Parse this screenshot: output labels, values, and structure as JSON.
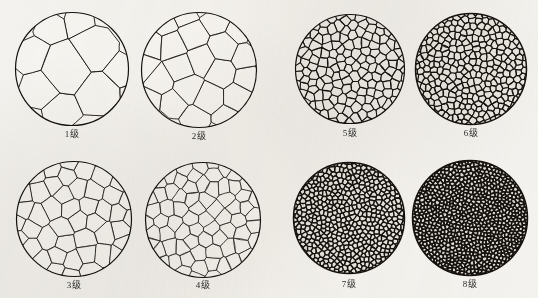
{
  "figure": {
    "title": "",
    "background_color": "#f4f2ee",
    "ink_color": "#15120f",
    "width": 538,
    "height": 298
  },
  "panels": [
    {
      "id": "grade-1",
      "label": "1级",
      "grade": 1,
      "group": "left",
      "row": 0,
      "col": 0,
      "circle": {
        "cx": 72,
        "cy": 69,
        "r": 57
      },
      "caption_y": 129,
      "cells": 11,
      "line_width": 0.9,
      "fill": "#f6f4f0",
      "seed": 1101
    },
    {
      "id": "grade-2",
      "label": "2级",
      "grade": 2,
      "group": "left",
      "row": 0,
      "col": 1,
      "circle": {
        "cx": 199,
        "cy": 70,
        "r": 58
      },
      "caption_y": 131,
      "cells": 26,
      "line_width": 0.85,
      "fill": "#f6f4f0",
      "seed": 2202
    },
    {
      "id": "grade-3",
      "label": "3级",
      "grade": 3,
      "group": "left",
      "row": 1,
      "col": 0,
      "circle": {
        "cx": 74,
        "cy": 219,
        "r": 58
      },
      "caption_y": 280,
      "cells": 56,
      "line_width": 0.8,
      "fill": "#f6f4f0",
      "seed": 3303
    },
    {
      "id": "grade-4",
      "label": "4级",
      "grade": 4,
      "group": "left",
      "row": 1,
      "col": 1,
      "circle": {
        "cx": 203,
        "cy": 220,
        "r": 58
      },
      "caption_y": 280,
      "cells": 95,
      "line_width": 0.75,
      "fill": "#f6f4f0",
      "seed": 4404
    },
    {
      "id": "grade-5",
      "label": "5级",
      "grade": 5,
      "group": "right",
      "row": 0,
      "col": 0,
      "circle": {
        "cx": 350,
        "cy": 69,
        "r": 55
      },
      "caption_y": 128,
      "cells": 210,
      "line_width": 1.05,
      "fill": "#eeece6",
      "seed": 5505
    },
    {
      "id": "grade-6",
      "label": "6级",
      "grade": 6,
      "group": "right",
      "row": 0,
      "col": 1,
      "circle": {
        "cx": 471,
        "cy": 69,
        "r": 56
      },
      "caption_y": 128,
      "cells": 420,
      "line_width": 1.2,
      "fill": "#eae7e0",
      "seed": 6606
    },
    {
      "id": "grade-7",
      "label": "7级",
      "grade": 7,
      "group": "right",
      "row": 1,
      "col": 0,
      "circle": {
        "cx": 349,
        "cy": 218,
        "r": 56
      },
      "caption_y": 279,
      "cells": 760,
      "line_width": 1.35,
      "fill": "#e6e3db",
      "seed": 7707
    },
    {
      "id": "grade-8",
      "label": "8级",
      "grade": 8,
      "group": "right",
      "row": 1,
      "col": 1,
      "circle": {
        "cx": 470,
        "cy": 218,
        "r": 58
      },
      "caption_y": 279,
      "cells": 1250,
      "line_width": 1.6,
      "fill": "#ded9cf",
      "seed": 8808
    }
  ],
  "chart_data": {
    "type": "table",
    "categories": [
      "1级",
      "2级",
      "3级",
      "4级",
      "5级",
      "6级",
      "7级",
      "8级"
    ],
    "series": [
      {
        "name": "晶粒数 (每圆内近似计数)",
        "values": [
          11,
          26,
          56,
          95,
          210,
          420,
          760,
          1250
        ]
      }
    ],
    "xlabel": "级别",
    "ylabel": "单位视场内晶粒数",
    "grid": false,
    "legend": "none"
  }
}
